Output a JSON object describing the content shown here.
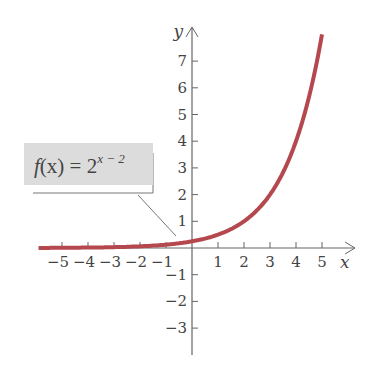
{
  "chart_data": {
    "type": "line",
    "title": "",
    "function_label": "f(x) = 2^(x − 2)",
    "label_parts": {
      "lhs_f": "f",
      "lhs_x": "(x)",
      "eq": " = 2",
      "exp": "x − 2"
    },
    "xlabel": "x",
    "ylabel": "y",
    "x_ticks": [
      -5,
      -4,
      -3,
      -2,
      -1,
      1,
      2,
      3,
      4,
      5
    ],
    "y_ticks": [
      -3,
      -2,
      -1,
      1,
      2,
      3,
      4,
      5,
      6,
      7
    ],
    "x_tick_labels": [
      "−5",
      "−4",
      "−3",
      "−2",
      "−1",
      "1",
      "2",
      "3",
      "4",
      "5"
    ],
    "y_tick_labels": [
      "−3",
      "−2",
      "−1",
      "1",
      "2",
      "3",
      "4",
      "5",
      "6",
      "7"
    ],
    "xlim": [
      -5.9,
      6
    ],
    "ylim": [
      -4,
      8.2
    ],
    "grid": false,
    "series": [
      {
        "name": "f(x) = 2^(x-2)",
        "color": "#b5484e",
        "x": [
          -5.9,
          -5,
          -4,
          -3,
          -2,
          -1,
          0,
          1,
          2,
          3,
          4,
          5
        ],
        "y": [
          0.004,
          0.008,
          0.016,
          0.031,
          0.063,
          0.125,
          0.25,
          0.5,
          1,
          2,
          4,
          8
        ]
      }
    ]
  },
  "colors": {
    "curve": "#b5484e",
    "axis": "#666666",
    "label_box": "#dcdcdc"
  }
}
